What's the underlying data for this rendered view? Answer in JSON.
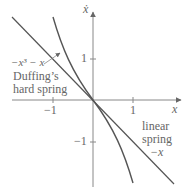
{
  "axes": {
    "x_label": "x",
    "y_label": "ẋ",
    "x_ticks": [
      {
        "value": -1,
        "label": "−1"
      },
      {
        "value": 1,
        "label": "1"
      }
    ],
    "y_ticks": [
      {
        "value": 1,
        "label": "1"
      },
      {
        "value": -1,
        "label": "−1"
      }
    ]
  },
  "curves": {
    "cubic": {
      "formula": "−x³ − x",
      "name_line1": "Duffing’s",
      "name_line2": "hard spring"
    },
    "linear": {
      "name_line1": "linear",
      "name_line2": "spring",
      "formula": "−x"
    }
  },
  "colors": {
    "curve": "#555555",
    "axis": "#777777",
    "text": "#666666"
  }
}
